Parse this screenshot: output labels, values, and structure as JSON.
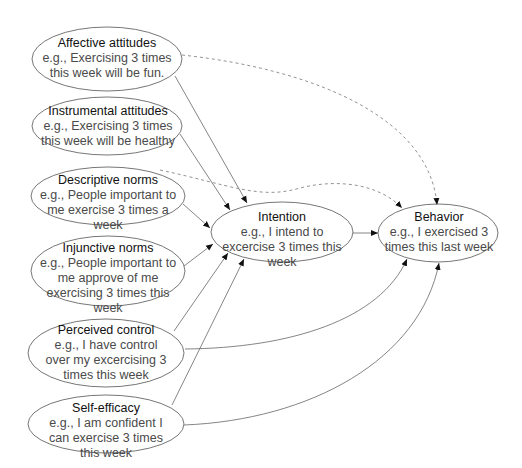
{
  "diagram": {
    "nodes": {
      "affective": {
        "title": "Affective attitudes",
        "example": "e.g., Exercising 3 times this week will be fun."
      },
      "instrumental": {
        "title": "Instrumental attitudes",
        "example": "e.g., Exercising 3 times this week will be healthy"
      },
      "descriptive": {
        "title": "Descriptive norms",
        "example": "e.g., People important to me exercise 3 times a week"
      },
      "injunctive": {
        "title": "Injunctive norms",
        "example": "e.g., People important to me approve of me exercising 3 times this week"
      },
      "perceived": {
        "title": "Perceived control",
        "example": "e.g., I have control over my excercising 3 times this week"
      },
      "selfefficacy": {
        "title": "Self-efficacy",
        "example": "e.g., I am confident I can exercise 3 times this week"
      },
      "intention": {
        "title": "Intention",
        "example": "e.g., I intend to excercise 3 times this week"
      },
      "behavior": {
        "title": "Behavior",
        "example": "e.g., I exercised 3 times this last week"
      }
    },
    "edges": [
      {
        "from": "Affective attitudes",
        "to": "Intention",
        "style": "solid"
      },
      {
        "from": "Instrumental attitudes",
        "to": "Intention",
        "style": "solid"
      },
      {
        "from": "Descriptive norms",
        "to": "Intention",
        "style": "solid"
      },
      {
        "from": "Injunctive norms",
        "to": "Intention",
        "style": "solid"
      },
      {
        "from": "Perceived control",
        "to": "Intention",
        "style": "solid"
      },
      {
        "from": "Self-efficacy",
        "to": "Intention",
        "style": "solid"
      },
      {
        "from": "Intention",
        "to": "Behavior",
        "style": "solid"
      },
      {
        "from": "Perceived control",
        "to": "Behavior",
        "style": "solid"
      },
      {
        "from": "Self-efficacy",
        "to": "Behavior",
        "style": "solid"
      },
      {
        "from": "Affective attitudes",
        "to": "Behavior",
        "style": "dashed"
      },
      {
        "from": "Descriptive norms",
        "to": "Behavior",
        "style": "dashed"
      }
    ],
    "colors": {
      "stroke": "#555555",
      "arrow": "#111111",
      "background": "#ffffff"
    }
  }
}
